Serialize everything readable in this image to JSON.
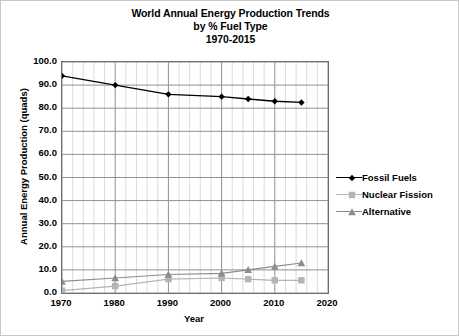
{
  "chart_data": {
    "type": "line",
    "title": "World Annual Energy Production Trends\nby % Fuel Type\n1970-2015",
    "title_line1": "World Annual Energy Production Trends",
    "title_line2": "by % Fuel Type",
    "title_line3": "1970-2015",
    "xlabel": "Year",
    "ylabel": "Annual Energy Production (quads)",
    "xlim": [
      1970,
      2020
    ],
    "ylim": [
      0,
      100
    ],
    "xticks": [
      1970,
      1980,
      1990,
      2000,
      2010,
      2020
    ],
    "xtick_labels": [
      "1970",
      "1980",
      "1990",
      "2000",
      "2010",
      "2020"
    ],
    "x_minor_step": 2,
    "yticks": [
      0,
      10,
      20,
      30,
      40,
      50,
      60,
      70,
      80,
      90,
      100
    ],
    "ytick_labels": [
      "0.0",
      "10.0",
      "20.0",
      "30.0",
      "40.0",
      "50.0",
      "60.0",
      "70.0",
      "80.0",
      "90.0",
      "100.0"
    ],
    "grid": true,
    "legend_position": "right",
    "x": [
      1970,
      1980,
      1990,
      2000,
      2005,
      2010,
      2015
    ],
    "series": [
      {
        "name": "Fossil Fuels",
        "color": "#000000",
        "marker": "diamond",
        "values": [
          94.0,
          90.0,
          86.0,
          85.0,
          84.0,
          83.0,
          82.5
        ]
      },
      {
        "name": "Nuclear Fission",
        "color": "#b4b4b4",
        "marker": "square",
        "values": [
          1.0,
          3.0,
          6.0,
          6.5,
          6.0,
          5.5,
          5.5
        ]
      },
      {
        "name": "Alternative",
        "color": "#8c8c8c",
        "marker": "triangle",
        "values": [
          5.0,
          6.5,
          8.0,
          8.5,
          10.0,
          11.5,
          13.0
        ]
      }
    ]
  },
  "legend": {
    "items": [
      {
        "label": "Fossil Fuels"
      },
      {
        "label": "Nuclear Fission"
      },
      {
        "label": "Alternative"
      }
    ]
  }
}
